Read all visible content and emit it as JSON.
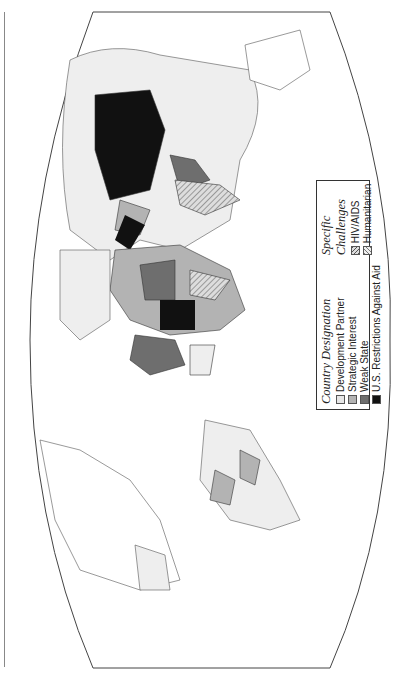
{
  "legend": {
    "country_designation": {
      "title": "Country Designation",
      "items": [
        {
          "label": "Development Partner",
          "color": "#e6e6e6"
        },
        {
          "label": "Strategic Interest",
          "color": "#b3b3b3"
        },
        {
          "label": "Weak State",
          "color": "#6e6e6e"
        },
        {
          "label": "U.S. Restrictions Against Aid",
          "color": "#111111"
        }
      ]
    },
    "specific_challenges": {
      "title": "Specific Challenges",
      "items": [
        {
          "label": "HIV/AIDS",
          "pattern": "hatch-dense"
        },
        {
          "label": "Humanitarian",
          "pattern": "hatch-light"
        }
      ]
    }
  },
  "map": {
    "orientation": "rotated 90° counter-clockwise",
    "projection": "world, curved frame"
  }
}
